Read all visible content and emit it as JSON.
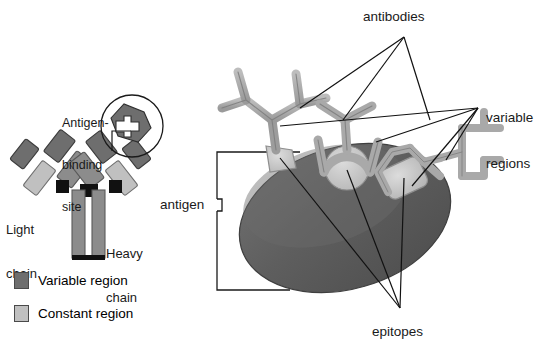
{
  "figure": {
    "background": "#ffffff"
  },
  "colors": {
    "variable_region": "#6e6e6e",
    "constant_region": "#c0c0c0",
    "disulfide_bond": "#111111",
    "antigen_body": "#5b5b5b",
    "antigen_highlight": "#6e6e6e",
    "epitope": "#c6c6c6",
    "antibody_arm": "#a9a9a9",
    "antibody_outline": "#7b7b7b",
    "leader_line": "#111111",
    "text": "#1a1a1a"
  },
  "labels": {
    "antigen_binding_site": "Antigen-\nbinding\nsite",
    "antigen_binding_site_lines": [
      "Antigen-",
      "binding",
      "site"
    ],
    "light_chain": "Light\nchain",
    "light_chain_lines": [
      "Light",
      "chain"
    ],
    "heavy_chain": "Heavy\nchain",
    "heavy_chain_lines": [
      "Heavy",
      "chain"
    ],
    "antibodies": "antibodies",
    "variable_regions": "variable\nregions",
    "variable_regions_lines": [
      "variable",
      "regions"
    ],
    "antigen": "antigen",
    "epitopes": "epitopes"
  },
  "legend": {
    "items": [
      {
        "label": "Variable region",
        "swatch": "#6e6e6e",
        "key": "variable"
      },
      {
        "label": "Constant region",
        "swatch": "#c0c0c0",
        "key": "constant"
      }
    ]
  },
  "left_panel": {
    "name": "single-antibody-schematic",
    "description": "Y-shaped immunoglobulin monomer with two light chains and two heavy chains",
    "parts": [
      "light-chain-left",
      "light-chain-right",
      "heavy-chain-left",
      "heavy-chain-right",
      "variable-tip-left",
      "variable-tip-right",
      "disulfide-bond-hinge",
      "antigen-binding-site-circle"
    ]
  },
  "right_panel": {
    "name": "antigen-with-bound-antibodies",
    "antibody_count": 3,
    "epitope_count": 3,
    "epitopes": [
      {
        "id": "epitope-left",
        "shape": "wedge"
      },
      {
        "id": "epitope-middle",
        "shape": "circle"
      },
      {
        "id": "epitope-right",
        "shape": "rounded-rectangle"
      }
    ],
    "antibodies": [
      {
        "id": "antibody-left",
        "orientation": "upright-y"
      },
      {
        "id": "antibody-middle",
        "orientation": "cradling-circle"
      },
      {
        "id": "antibody-right",
        "orientation": "tilted-right"
      }
    ]
  }
}
